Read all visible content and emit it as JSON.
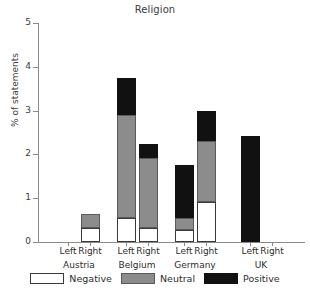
{
  "chart_data": {
    "type": "bar",
    "title": "Religion",
    "xlabel": "",
    "ylabel": "% of statements",
    "ylim": [
      0,
      5
    ],
    "yticks": [
      0,
      1,
      2,
      3,
      4,
      5
    ],
    "ytick_labels": [
      "0",
      "1",
      "2",
      "3",
      "4",
      "5"
    ],
    "grid": false,
    "stacked": true,
    "legend_position": "bottom",
    "groups": [
      "Austria",
      "Belgium",
      "Germany",
      "UK"
    ],
    "subcategories": [
      "Left",
      "Right"
    ],
    "categories": [
      "Austria Left",
      "Austria Right",
      "Belgium Left",
      "Belgium Right",
      "Germany Left",
      "Germany Right",
      "UK Left",
      "UK Right"
    ],
    "series": [
      {
        "name": "Negative",
        "color": "#ffffff",
        "values": [
          0.0,
          0.31,
          0.55,
          0.33,
          0.28,
          0.92,
          0.0,
          0.0
        ]
      },
      {
        "name": "Neutral",
        "color": "#8c8c8c",
        "values": [
          0.0,
          0.34,
          2.35,
          1.59,
          0.27,
          1.38,
          0.0,
          0.0
        ]
      },
      {
        "name": "Positive",
        "color": "#111111",
        "values": [
          0.0,
          0.0,
          0.85,
          0.32,
          1.2,
          0.7,
          2.43,
          0.0
        ]
      }
    ],
    "totals": [
      0.0,
      0.65,
      3.75,
      2.24,
      1.75,
      3.0,
      2.43,
      0.0
    ]
  },
  "legend": {
    "items": [
      {
        "label": "Negative",
        "swatch": "neg"
      },
      {
        "label": "Neutral",
        "swatch": "neu"
      },
      {
        "label": "Positive",
        "swatch": "pos"
      }
    ]
  },
  "axis": {
    "ytick_labels": [
      "0",
      "1",
      "2",
      "3",
      "4",
      "5"
    ]
  },
  "xaxis": {
    "groups": [
      {
        "country": "Austria",
        "left": "Left",
        "right": "Right"
      },
      {
        "country": "Belgium",
        "left": "Left",
        "right": "Right"
      },
      {
        "country": "Germany",
        "left": "Left",
        "right": "Right"
      },
      {
        "country": "UK",
        "left": "Left",
        "right": "Right"
      }
    ]
  }
}
